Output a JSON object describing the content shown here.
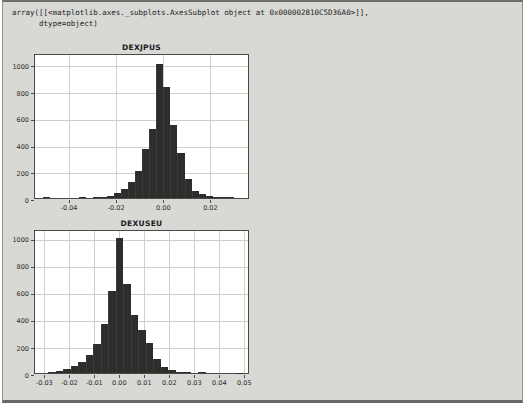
{
  "code_output": {
    "line1": "array([[<matplotlib.axes._subplots.AxesSubplot object at 0x000002810C5D36A0>]],",
    "line2": "      dtype=object)"
  },
  "colors": {
    "panel_bg": "#d8d8d5",
    "plot_bg": "#ffffff",
    "bar": "#2d2d2b",
    "grid": "#cfcfcc",
    "spine": "#4a4a48"
  },
  "chart_data": [
    {
      "type": "bar",
      "subtype": "histogram",
      "title": "DEXJPUS",
      "xlabel": "",
      "ylabel": "",
      "bin_start": -0.051,
      "bin_width": 0.003,
      "values": [
        6,
        0,
        0,
        0,
        0,
        5,
        0,
        6,
        8,
        16,
        35,
        65,
        120,
        205,
        370,
        520,
        1000,
        830,
        550,
        340,
        145,
        55,
        30,
        15,
        8,
        6,
        5
      ],
      "xlim": [
        -0.0545,
        0.0368
      ],
      "ylim": [
        0,
        1085
      ],
      "xtick_values": [
        -0.04,
        -0.02,
        0.0,
        0.02
      ],
      "xtick_labels": [
        "-0.04",
        "-0.02",
        "0.00",
        "0.02"
      ],
      "ytick_values": [
        0,
        200,
        400,
        600,
        800,
        1000
      ],
      "ytick_labels": [
        "0",
        "200",
        "400",
        "600",
        "800",
        "1000"
      ],
      "grid": true,
      "legend": false
    },
    {
      "type": "bar",
      "subtype": "histogram",
      "title": "DEXUSEU",
      "xlabel": "",
      "ylabel": "",
      "bin_start": -0.0285,
      "bin_width": 0.003,
      "values": [
        7,
        15,
        29,
        51,
        80,
        132,
        215,
        365,
        610,
        1000,
        660,
        430,
        320,
        220,
        100,
        45,
        22,
        10,
        5,
        0,
        4,
        0,
        0,
        0,
        0,
        2
      ],
      "xlim": [
        -0.0337,
        0.0523
      ],
      "ylim": [
        0,
        1065
      ],
      "xtick_values": [
        -0.03,
        -0.02,
        -0.01,
        0.0,
        0.01,
        0.02,
        0.03,
        0.04,
        0.05
      ],
      "xtick_labels": [
        "-0.03",
        "-0.02",
        "-0.01",
        "0.00",
        "0.01",
        "0.02",
        "0.03",
        "0.04",
        "0.05"
      ],
      "ytick_values": [
        0,
        200,
        400,
        600,
        800,
        1000
      ],
      "ytick_labels": [
        "0",
        "200",
        "400",
        "600",
        "800",
        "1000"
      ],
      "grid": true,
      "legend": false
    }
  ]
}
